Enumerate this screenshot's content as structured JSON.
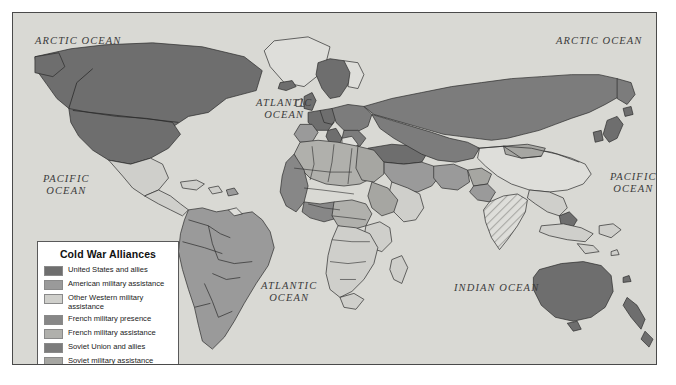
{
  "map": {
    "title": "Cold War Alliances",
    "ocean_labels": [
      {
        "name": "arctic-ocean-west",
        "text": "ARCTIC OCEAN"
      },
      {
        "name": "arctic-ocean-east",
        "text": "ARCTIC OCEAN"
      },
      {
        "name": "atlantic-ocean-north",
        "text": "ATLANTIC\nOCEAN"
      },
      {
        "name": "atlantic-ocean-south",
        "text": "ATLANTIC\nOCEAN"
      },
      {
        "name": "pacific-ocean-west",
        "text": "PACIFIC\nOCEAN"
      },
      {
        "name": "pacific-ocean-east",
        "text": "PACIFIC\nOCEAN"
      },
      {
        "name": "indian-ocean",
        "text": "INDIAN OCEAN"
      }
    ],
    "ocean_fill": "#d9d9d4",
    "frame_color": "#4a4a4a"
  },
  "legend": {
    "title": "Cold War Alliances",
    "items": [
      {
        "label": "United States and allies",
        "color": "#6e6e6e",
        "pattern": "solid"
      },
      {
        "label": "American military assistance",
        "color": "#9a9a9a",
        "pattern": "solid"
      },
      {
        "label": "Other Western military assistance",
        "color": "#cfcfcb",
        "pattern": "solid"
      },
      {
        "label": "French military presence",
        "color": "#878787",
        "pattern": "solid"
      },
      {
        "label": "French military assistance",
        "color": "#b0b0ac",
        "pattern": "solid"
      },
      {
        "label": "Soviet Union and allies",
        "color": "#7c7c7c",
        "pattern": "solid"
      },
      {
        "label": "Soviet military assistance",
        "color": "#a6a6a2",
        "pattern": "solid"
      },
      {
        "label": "Nonaligned nations",
        "color": "#dedeDA",
        "pattern": "solid"
      }
    ]
  }
}
